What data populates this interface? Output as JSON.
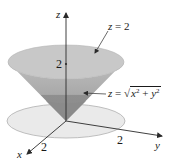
{
  "figure": {
    "type": "3d-surface-diagram",
    "colors": {
      "cap_fill": "#c8c8c8",
      "cone_upper_fill": "#b4b4b4",
      "cone_lower_fill": "#8e8e8e",
      "disk_fill": "#eaeaea",
      "disk_stroke": "#b0b0b0",
      "axis_stroke": "#2a2a2a",
      "text": "#1a1a1a"
    },
    "axes": {
      "x": {
        "label": "x",
        "tick_label": "2"
      },
      "y": {
        "label": "y",
        "tick_label": "2"
      },
      "z": {
        "label": "z",
        "tick_label": "2"
      }
    },
    "annotations": {
      "plane": {
        "lhs": "z",
        "eq": " = ",
        "rhs": "2"
      },
      "cone": {
        "lhs": "z",
        "eq": " = ",
        "sqrt_symbol": "√",
        "x": "x",
        "plus": " + ",
        "y": "y",
        "exp": "2"
      }
    }
  }
}
